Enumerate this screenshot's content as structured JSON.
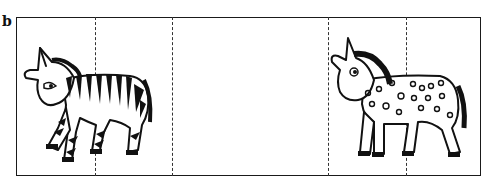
{
  "figure": {
    "panel_label": "b",
    "strip": {
      "left": 16,
      "top": 17,
      "right": 481,
      "bottom": 176,
      "border_color": "#1a1a1a"
    },
    "fold_lines_x": [
      95,
      172,
      328,
      406
    ],
    "illustrations": [
      {
        "name": "zebra",
        "description": "striped zebra facing left",
        "position": "left panels"
      },
      {
        "name": "spotted-horse",
        "description": "spotted horse facing left",
        "position": "right panels"
      }
    ]
  }
}
